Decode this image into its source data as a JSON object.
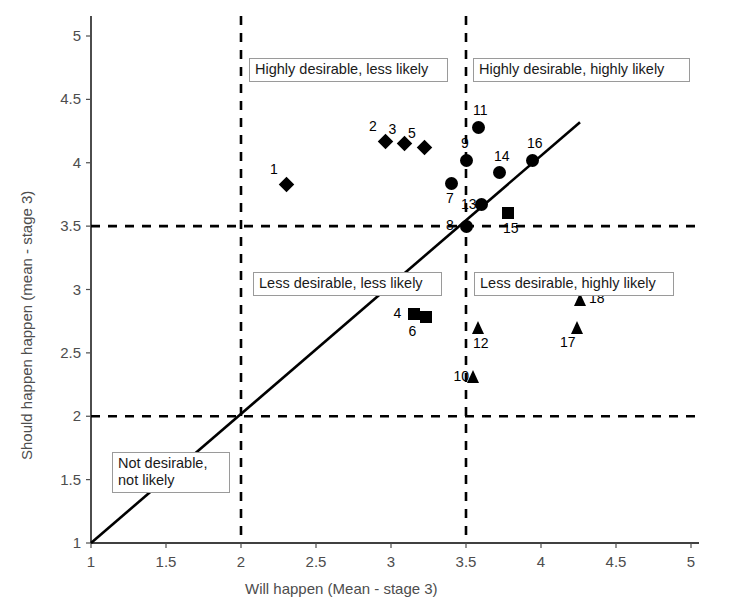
{
  "chart_data": {
    "type": "scatter",
    "title": "",
    "xlabel": "Will happen (Mean - stage 3)",
    "ylabel": "Should happen happen (mean - stage 3)",
    "xlim": [
      1,
      5
    ],
    "ylim": [
      1,
      5
    ],
    "xticks": [
      "1",
      "1.5",
      "2",
      "2.5",
      "3",
      "3.5",
      "4",
      "4.5",
      "5"
    ],
    "xtick_values": [
      1,
      1.5,
      2,
      2.5,
      3,
      3.5,
      4,
      4.5,
      5
    ],
    "yticks": [
      "1",
      "1.5",
      "2",
      "2.5",
      "3",
      "3.5",
      "4",
      "4.5",
      "5"
    ],
    "ytick_values": [
      1,
      1.5,
      2,
      2.5,
      3,
      3.5,
      4,
      4.5,
      5
    ],
    "grid": false,
    "legend": "none",
    "reference_lines": [
      {
        "name": "vertical-divider-2",
        "orientation": "vertical",
        "value": 2,
        "style": "dashed"
      },
      {
        "name": "vertical-divider-3.5",
        "orientation": "vertical",
        "value": 3.5,
        "style": "dashed"
      },
      {
        "name": "horizontal-divider-2",
        "orientation": "horizontal",
        "value": 2,
        "style": "dashed"
      },
      {
        "name": "horizontal-divider-3.5",
        "orientation": "horizontal",
        "value": 3.5,
        "style": "dashed"
      },
      {
        "name": "identity-line",
        "orientation": "diagonal",
        "from": [
          1,
          1
        ],
        "to": [
          4.26,
          4.32
        ],
        "style": "solid"
      }
    ],
    "points": [
      {
        "label": "1",
        "x": 2.3,
        "y": 3.83,
        "marker": "diamond",
        "label_pos": "up-left"
      },
      {
        "label": "2",
        "x": 2.96,
        "y": 4.17,
        "marker": "diamond",
        "label_pos": "up-left"
      },
      {
        "label": "3",
        "x": 3.09,
        "y": 4.15,
        "marker": "diamond",
        "label_pos": "up-left"
      },
      {
        "label": "4",
        "x": 3.15,
        "y": 2.81,
        "marker": "square",
        "label_pos": "left"
      },
      {
        "label": "5",
        "x": 3.22,
        "y": 4.12,
        "marker": "diamond",
        "label_pos": "up-left"
      },
      {
        "label": "6",
        "x": 3.23,
        "y": 2.78,
        "marker": "square",
        "label_pos": "down-left"
      },
      {
        "label": "7",
        "x": 3.4,
        "y": 3.84,
        "marker": "circle",
        "label_pos": "down"
      },
      {
        "label": "8",
        "x": 3.5,
        "y": 3.5,
        "marker": "circle",
        "label_pos": "left"
      },
      {
        "label": "9",
        "x": 3.5,
        "y": 4.02,
        "marker": "circle",
        "label_pos": "up"
      },
      {
        "label": "10",
        "x": 3.55,
        "y": 2.31,
        "marker": "triangle",
        "label_pos": "left"
      },
      {
        "label": "11",
        "x": 3.58,
        "y": 4.28,
        "marker": "circle",
        "label_pos": "up"
      },
      {
        "label": "12",
        "x": 3.58,
        "y": 2.7,
        "marker": "triangle",
        "label_pos": "down"
      },
      {
        "label": "13",
        "x": 3.6,
        "y": 3.67,
        "marker": "circle",
        "label_pos": "left"
      },
      {
        "label": "14",
        "x": 3.72,
        "y": 3.92,
        "marker": "circle",
        "label_pos": "up"
      },
      {
        "label": "15",
        "x": 3.78,
        "y": 3.6,
        "marker": "square",
        "label_pos": "down"
      },
      {
        "label": "16",
        "x": 3.94,
        "y": 4.02,
        "marker": "circle",
        "label_pos": "up"
      },
      {
        "label": "17",
        "x": 4.24,
        "y": 2.7,
        "marker": "triangle",
        "label_pos": "down-left"
      },
      {
        "label": "18",
        "x": 4.26,
        "y": 2.92,
        "marker": "triangle",
        "label_pos": "right"
      }
    ],
    "quadrant_labels": [
      {
        "name": "highly-desirable-less-likely",
        "text": "Highly desirable, less likely",
        "x_px": 249,
        "y_px": 58,
        "w_px": 199
      },
      {
        "name": "highly-desirable-highly-likely",
        "text": "Highly desirable, highly likely",
        "x_px": 473,
        "y_px": 58,
        "w_px": 217
      },
      {
        "name": "less-desirable-less-likely",
        "text": "Less desirable, less likely",
        "x_px": 253,
        "y_px": 272,
        "w_px": 189
      },
      {
        "name": "less-desirable-highly-likely",
        "text": "Less desirable, highly likely",
        "x_px": 474,
        "y_px": 272,
        "w_px": 200
      },
      {
        "name": "not-desirable-not-likely",
        "text": "Not desirable, not likely",
        "x_px": 112,
        "y_px": 452,
        "w_px": 118,
        "two_line": true
      }
    ],
    "colors": {
      "marker": "#000000",
      "axis_text": "#4d4d4d",
      "label_text": "#000000",
      "reference_line": "#000000",
      "box_border": "#9a9a9a",
      "background": "#ffffff"
    }
  }
}
